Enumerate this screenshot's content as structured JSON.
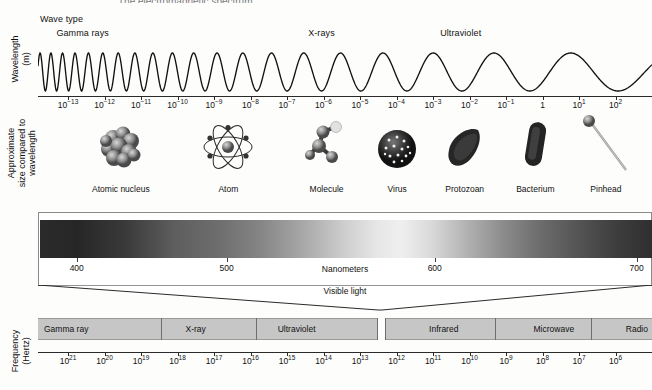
{
  "title": "The electromagnetic spectrum",
  "axes_titles": {
    "wavelength": "Wavelength\n(m)",
    "wavelength_line1": "Wavelength",
    "wavelength_line2": "(m)",
    "size_line1": "Approximate",
    "size_line2": "size compared to",
    "size_line3": "wavelength",
    "frequency_line1": "Frequency",
    "frequency_line2": "(Hertz)"
  },
  "wave_type": {
    "header": "Wave type",
    "labels": [
      {
        "text": "Gamma rays",
        "x_pct": 3.0
      },
      {
        "text": "X-rays",
        "x_pct": 44.0
      },
      {
        "text": "Ultraviolet",
        "x_pct": 65.5
      },
      {
        "text": "Visible",
        "x_pct": 103.0
      },
      {
        "text": "Infrared",
        "x_pct": 127.0
      },
      {
        "text": "Microwave",
        "x_pct": 181.0
      },
      {
        "text": "Radio",
        "x_pct": 227.0
      }
    ]
  },
  "chart_data": {
    "type": "line",
    "title": "The electromagnetic spectrum",
    "xlabel": "Wavelength (m)",
    "ylabel": "",
    "grid": false,
    "legend": "none",
    "wavelength_axis": {
      "label": "Wavelength (m)",
      "ticks": [
        "10-13",
        "10-12",
        "10-11",
        "10-10",
        "10-9",
        "10-8",
        "10-7",
        "10-6",
        "10-5",
        "10-4",
        "10-3",
        "10-2",
        "10-1",
        "1",
        "101",
        "102"
      ],
      "tick_exponents": [
        -13,
        -12,
        -11,
        -10,
        -9,
        -8,
        -7,
        -6,
        -5,
        -4,
        -3,
        -2,
        -1,
        0,
        1,
        2
      ],
      "range": [
        -13,
        2
      ]
    },
    "frequency_axis": {
      "label": "Frequency (Hertz)",
      "ticks": [
        "1021",
        "1020",
        "1019",
        "1018",
        "1017",
        "1016",
        "1015",
        "1014",
        "1013",
        "1012",
        "1011",
        "1010",
        "109",
        "108",
        "107",
        "106"
      ],
      "tick_exponents": [
        21,
        20,
        19,
        18,
        17,
        16,
        15,
        14,
        13,
        12,
        11,
        10,
        9,
        8,
        7,
        6
      ],
      "range": [
        21,
        6
      ]
    },
    "visible_light_axis": {
      "label": "Nanometers",
      "ticks": [
        400,
        500,
        600,
        700
      ],
      "range": [
        380,
        720
      ],
      "caption": "Visible light"
    },
    "bands_wave_type": [
      "Gamma rays",
      "X-rays",
      "Ultraviolet",
      "Visible",
      "Infrared",
      "Microwave",
      "Radio"
    ],
    "bands_frequency": [
      "Gamma ray",
      "X-ray",
      "Ultraviolet",
      "Infrared",
      "Microwave",
      "Radio"
    ],
    "size_comparisons": [
      "Atomic nucleus",
      "Atom",
      "Molecule",
      "Virus",
      "Protozoan",
      "Bacterium",
      "Pinhead",
      "Butterfly",
      "Human",
      "Football field"
    ],
    "series": [
      {
        "name": "Electromagnetic wave",
        "description": "Sinusoid whose wavelength increases logarithmically from left (gamma) to right (radio)"
      }
    ]
  },
  "wavelength_ticks": [
    {
      "label_base": "10",
      "exp": "−13"
    },
    {
      "label_base": "10",
      "exp": "−12"
    },
    {
      "label_base": "10",
      "exp": "−11"
    },
    {
      "label_base": "10",
      "exp": "−10"
    },
    {
      "label_base": "10",
      "exp": "−9"
    },
    {
      "label_base": "10",
      "exp": "−8"
    },
    {
      "label_base": "10",
      "exp": "−7"
    },
    {
      "label_base": "10",
      "exp": "−6"
    },
    {
      "label_base": "10",
      "exp": "−5"
    },
    {
      "label_base": "10",
      "exp": "−4"
    },
    {
      "label_base": "10",
      "exp": "−3"
    },
    {
      "label_base": "10",
      "exp": "−2"
    },
    {
      "label_base": "10",
      "exp": "−1"
    },
    {
      "label_base": "1",
      "exp": ""
    },
    {
      "label_base": "10",
      "exp": "1"
    },
    {
      "label_base": "10",
      "exp": "2"
    }
  ],
  "frequency_ticks": [
    {
      "label_base": "10",
      "exp": "21"
    },
    {
      "label_base": "10",
      "exp": "20"
    },
    {
      "label_base": "10",
      "exp": "19"
    },
    {
      "label_base": "10",
      "exp": "18"
    },
    {
      "label_base": "10",
      "exp": "17"
    },
    {
      "label_base": "10",
      "exp": "16"
    },
    {
      "label_base": "10",
      "exp": "15"
    },
    {
      "label_base": "10",
      "exp": "14"
    },
    {
      "label_base": "10",
      "exp": "13"
    },
    {
      "label_base": "10",
      "exp": "12"
    },
    {
      "label_base": "10",
      "exp": "11"
    },
    {
      "label_base": "10",
      "exp": "10"
    },
    {
      "label_base": "10",
      "exp": "9"
    },
    {
      "label_base": "10",
      "exp": "8"
    },
    {
      "label_base": "10",
      "exp": "7"
    },
    {
      "label_base": "10",
      "exp": "6"
    }
  ],
  "objects": [
    {
      "name": "Atomic nucleus",
      "icon": "atomic-nucleus-icon",
      "x_pct": 13.5
    },
    {
      "name": "Atom",
      "icon": "atom-icon",
      "x_pct": 31.0
    },
    {
      "name": "Molecule",
      "icon": "molecule-icon",
      "x_pct": 47.0
    },
    {
      "name": "Virus",
      "icon": "virus-icon",
      "x_pct": 58.5
    },
    {
      "name": "Protozoan",
      "icon": "protozoan-icon",
      "x_pct": 69.5
    },
    {
      "name": "Bacterium",
      "icon": "bacterium-icon",
      "x_pct": 81.0
    },
    {
      "name": "Pinhead",
      "icon": "pinhead-icon",
      "x_pct": 92.5
    },
    {
      "name": "Butterfly",
      "icon": "butterfly-icon",
      "x_pct": 112.0
    },
    {
      "name": "Human",
      "icon": "human-icon",
      "x_pct": 127.5
    },
    {
      "name": "Football field",
      "icon": "football-field-icon",
      "x_pct": 146.0
    }
  ],
  "visible_spectrum": {
    "caption": "Visible light",
    "unit_label": "Nanometers",
    "ticks": [
      "400",
      "500",
      "600",
      "700"
    ]
  },
  "frequency_bands": [
    {
      "name": "Gamma ray",
      "left_pct": 0.0,
      "width_pct": 20.0
    },
    {
      "name": "X-ray",
      "left_pct": 20.0,
      "width_pct": 15.5
    },
    {
      "name": "Ultraviolet",
      "left_pct": 35.5,
      "width_pct": 19.7
    },
    {
      "name": "Infrared",
      "left_pct": 56.5,
      "width_pct": 18.0
    },
    {
      "name": "Microwave",
      "left_pct": 74.5,
      "width_pct": 15.5
    },
    {
      "name": "Radio",
      "left_pct": 90.0,
      "width_pct": 10.0
    }
  ],
  "colors": {
    "ink": "#111111",
    "axis": "#2a2a2a",
    "band_fill": "#c6c6c6",
    "band_edge": "#9a9a9a",
    "page": "#fdfdfc"
  }
}
